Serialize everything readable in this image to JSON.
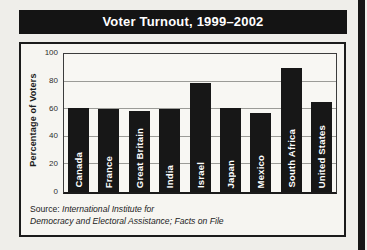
{
  "title": "Voter Turnout, 1999–2002",
  "y_axis": {
    "label": "Percentage of Voters"
  },
  "source": {
    "prefix": "Source: ",
    "line1": "International Institute for",
    "line2": "Democracy and Electoral Assistance; Facts on File"
  },
  "colors": {
    "ink": "#171717",
    "banner_bg": "#141414",
    "page_bg": "#efeeea",
    "card_bg": "#f6f5f1",
    "plot_bg": "#f8f7f3",
    "gridline": "#9b9b97",
    "title_text": "#ffffff",
    "bar_label_text": "#ffffff"
  },
  "chart_data": {
    "type": "bar",
    "categories": [
      "Canada",
      "France",
      "Great Britain",
      "India",
      "Israel",
      "Japan",
      "Mexico",
      "South Africa",
      "United States"
    ],
    "values": [
      61,
      60,
      59,
      60,
      79,
      61,
      57,
      90,
      65
    ],
    "title": "Voter Turnout, 1999–2002",
    "xlabel": "",
    "ylabel": "Percentage of Voters",
    "ylim": [
      0,
      100
    ],
    "yticks": [
      0,
      20,
      40,
      60,
      80,
      100
    ],
    "grid": "horizontal",
    "legend": "none",
    "bar_color": "#171717",
    "bar_label_position": "inside-bottom-rotated"
  }
}
